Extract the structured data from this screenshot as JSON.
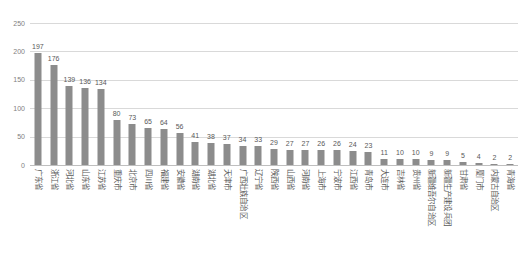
{
  "chart_data": {
    "type": "bar",
    "title": "",
    "subtitle": "",
    "xlabel": "",
    "ylabel": "",
    "ylim": [
      0,
      250
    ],
    "yticks": [
      0,
      50,
      100,
      150,
      200,
      250
    ],
    "grid": true,
    "legend": false,
    "legend_position": "none",
    "orientation": "vertical",
    "label_rotation": 90,
    "bar_color": "#8c8c8c",
    "grid_color": "#d9d9d9",
    "text_color": "#595959",
    "categories": [
      "广东省",
      "浙江省",
      "河北省",
      "山东省",
      "江苏省",
      "重庆市",
      "北京市",
      "四川省",
      "福建省",
      "安徽省",
      "湖南省",
      "湖北省",
      "天津市",
      "广西壮族自治区",
      "辽宁省",
      "陕西省",
      "山西省",
      "河南省",
      "上海市",
      "宁波市",
      "江西省",
      "青岛市",
      "大连市",
      "吉林省",
      "贵州省",
      "新疆维吾尔自治区",
      "新疆生产建设兵团",
      "甘肃省",
      "厦门市",
      "内蒙古自治区",
      "青海省"
    ],
    "values": [
      197,
      176,
      139,
      136,
      134,
      80,
      73,
      65,
      64,
      56,
      41,
      38,
      37,
      34,
      33,
      29,
      27,
      27,
      26,
      26,
      24,
      23,
      11,
      10,
      10,
      9,
      9,
      5,
      4,
      2,
      2
    ]
  }
}
